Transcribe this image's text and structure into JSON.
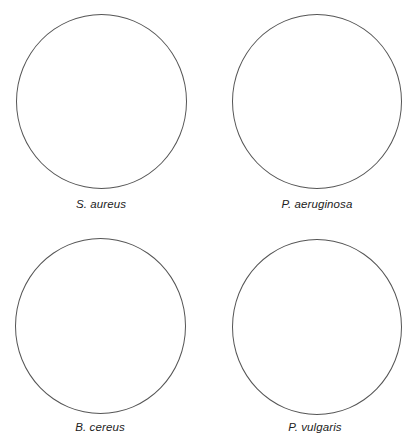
{
  "plates": [
    {
      "label": "S. aureus"
    },
    {
      "label": "P. aeruginosa"
    },
    {
      "label": "B. cereus"
    },
    {
      "label": "P. vulgaris"
    }
  ],
  "colors": {
    "outline": "#555555",
    "text": "#222222",
    "background": "#ffffff"
  }
}
